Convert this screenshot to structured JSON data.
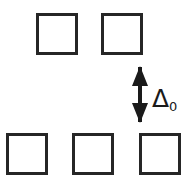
{
  "figure": {
    "type": "diagram",
    "name": "energy-level-splitting-diagram",
    "width": 194,
    "height": 178,
    "background_color": "#ffffff",
    "stroke_color": "#262626",
    "stroke_width": 3
  },
  "rows": [
    {
      "name": "upper-row",
      "y": 13,
      "squares": [
        {
          "label": "",
          "x": 36,
          "y": 13,
          "w": 42,
          "h": 42
        },
        {
          "label": "",
          "x": 101,
          "y": 13,
          "w": 42,
          "h": 42
        }
      ]
    },
    {
      "name": "lower-row",
      "y": 133,
      "squares": [
        {
          "label": "",
          "x": 6,
          "y": 133,
          "w": 42,
          "h": 42
        },
        {
          "label": "",
          "x": 72,
          "y": 133,
          "w": 42,
          "h": 42
        },
        {
          "label": "",
          "x": 139,
          "y": 133,
          "w": 42,
          "h": 42
        }
      ]
    }
  ],
  "annotation": {
    "arrow": {
      "name": "gap-arrow",
      "style": "double-headed-vertical",
      "x": 140,
      "y_top": 67,
      "y_bottom": 122,
      "color": "#1a1a1a"
    },
    "label": {
      "name": "gap-label",
      "symbol": "Δ",
      "subscript": "0",
      "text": "Δ0",
      "x": 152,
      "y": 86,
      "color": "#1a1a1a"
    }
  }
}
